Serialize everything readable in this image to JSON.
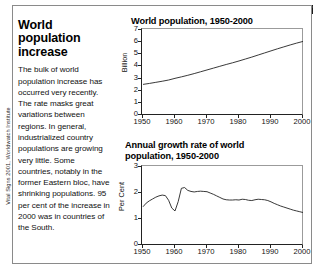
{
  "credit": "Vital Signs 2001, Worldwatch Institute",
  "article": {
    "headline": "World population increase",
    "body": "The bulk of world population increase has occurred very recently. The rate masks great variations between regions. In general, industrialized country populations are growing very little. Some countries, notably in the former Eastern bloc, have shrinking populations. 95 per cent of the increase in 2000 was in countries of the South."
  },
  "chart_data": [
    {
      "id": "population",
      "type": "line",
      "title": "World population, 1950-2000",
      "xlabel": "",
      "ylabel": "Billion",
      "ylim": [
        0,
        7
      ],
      "xlim": [
        1950,
        2000
      ],
      "yticks": [
        "7",
        "6",
        "5",
        "4",
        "3",
        "2",
        "1",
        "0"
      ],
      "ytick_values": [
        7,
        6,
        5,
        4,
        3,
        2,
        1,
        0
      ],
      "xticks": [
        "1950",
        "1960",
        "1970",
        "1980",
        "1990",
        "2000"
      ],
      "xtick_values": [
        1950,
        1960,
        1970,
        1980,
        1990,
        2000
      ],
      "grid": false,
      "legend": "none",
      "x": [
        1950,
        1952,
        1954,
        1956,
        1958,
        1960,
        1962,
        1964,
        1966,
        1968,
        1970,
        1972,
        1974,
        1976,
        1978,
        1980,
        1982,
        1984,
        1986,
        1988,
        1990,
        1992,
        1994,
        1996,
        1998,
        2000
      ],
      "values": [
        2.52,
        2.6,
        2.69,
        2.78,
        2.88,
        3.02,
        3.14,
        3.27,
        3.41,
        3.56,
        3.71,
        3.86,
        4.01,
        4.16,
        4.3,
        4.45,
        4.61,
        4.77,
        4.94,
        5.11,
        5.28,
        5.45,
        5.61,
        5.77,
        5.92,
        6.06
      ]
    },
    {
      "id": "growth",
      "type": "line",
      "title": "Annual growth rate of world\npopulation, 1950-2000",
      "xlabel": "",
      "ylabel": "Per Cent",
      "ylim": [
        0,
        3
      ],
      "xlim": [
        1950,
        2000
      ],
      "yticks": [
        "3",
        "2",
        "1",
        "0"
      ],
      "ytick_values": [
        3,
        2,
        1,
        0
      ],
      "xticks": [
        "1950",
        "1960",
        "1970",
        "1980",
        "1990",
        "2000"
      ],
      "xtick_values": [
        1950,
        1960,
        1970,
        1980,
        1990,
        2000
      ],
      "grid": false,
      "legend": "none",
      "x": [
        1950,
        1951,
        1952,
        1953,
        1954,
        1955,
        1956,
        1957,
        1958,
        1959,
        1960,
        1961,
        1962,
        1963,
        1964,
        1965,
        1966,
        1967,
        1968,
        1969,
        1970,
        1971,
        1972,
        1973,
        1974,
        1975,
        1976,
        1977,
        1978,
        1979,
        1980,
        1981,
        1982,
        1983,
        1984,
        1985,
        1986,
        1987,
        1988,
        1989,
        1990,
        1991,
        1992,
        1993,
        1994,
        1995,
        1996,
        1997,
        1998,
        1999,
        2000
      ],
      "values": [
        1.47,
        1.61,
        1.7,
        1.77,
        1.84,
        1.89,
        1.92,
        1.9,
        1.72,
        1.42,
        1.31,
        1.67,
        2.18,
        2.21,
        2.1,
        2.06,
        2.04,
        2.06,
        2.07,
        2.06,
        2.05,
        2.0,
        1.95,
        1.89,
        1.83,
        1.77,
        1.74,
        1.73,
        1.73,
        1.74,
        1.73,
        1.76,
        1.75,
        1.72,
        1.71,
        1.74,
        1.76,
        1.75,
        1.74,
        1.71,
        1.66,
        1.6,
        1.55,
        1.5,
        1.46,
        1.42,
        1.38,
        1.34,
        1.31,
        1.28,
        1.25
      ]
    }
  ]
}
